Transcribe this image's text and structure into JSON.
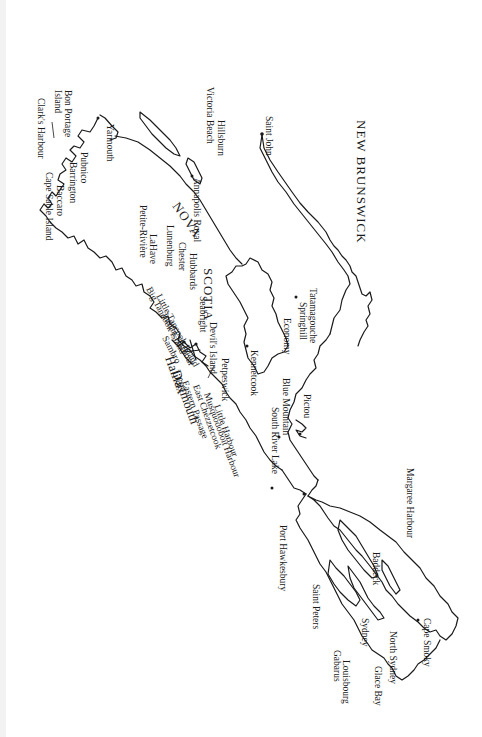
{
  "map": {
    "orientation": "rotated-90-clockwise",
    "regions": {
      "new_brunswick": "NEW BRUNSWICK",
      "nova": "NOVA",
      "scotia": "SCOTIA"
    },
    "cities_major": {
      "halifax": "Halifax",
      "dartmouth": "Dartmouth"
    },
    "places": {
      "saint_john": "Saint John",
      "hillsburn": "Hillsburn",
      "victoria_beach": "Victoria Beach",
      "annapolis_royal": "Annapolis Royal",
      "yarmouth": "Yarmouth",
      "bon_portage_1": "Bon Portage",
      "bon_portage_2": "Island",
      "clarks_harbour": "Clark's Harbour",
      "pubnico": "Pubnico",
      "barrington": "Barrington",
      "baccaro": "Baccaro",
      "cape_sable_island": "Cape Sable Island",
      "petite_riviere": "Petite-Rivière",
      "lahave": "LaHave",
      "lunenburg": "Lunenburg",
      "chester": "Chester",
      "hubbards": "Hubbards",
      "big_tancook": "Big Tancook Island",
      "little_tancook": "Little Tancook Island",
      "indian_harbour": "Indian Harbour",
      "sambro": "Sambro",
      "seabright": "Seabright",
      "devils_island": "Devil's Island",
      "eastern_passage": "Eastern Passage",
      "east_chezzetcook": "East Chezzetcook",
      "musquodoboit_harbour": "Musquodoboit Harbour",
      "little_harbour": "Little Harbour",
      "petpeswick": "Petpeswick",
      "tatamagouche": "Tatamagouche",
      "springhill": "Springhill",
      "economy": "Economy",
      "kennetcook": "Kennetcook",
      "pictou": "Pictou",
      "blue_mountain": "Blue Mountain",
      "south_river_lake": "South River Lake",
      "port_hawkesbury": "Port Hawkesbury",
      "margaree_harbour": "Margaree Harbour",
      "baddeck": "Baddeck",
      "saint_peters": "Saint Peters",
      "sydney": "Sydney",
      "north_sydney": "North Sydney",
      "glace_bay": "Glace Bay",
      "gabarus": "Gabarus",
      "louisbourg": "Louisbourg",
      "cape_smoky": "Cape Smoky"
    }
  }
}
